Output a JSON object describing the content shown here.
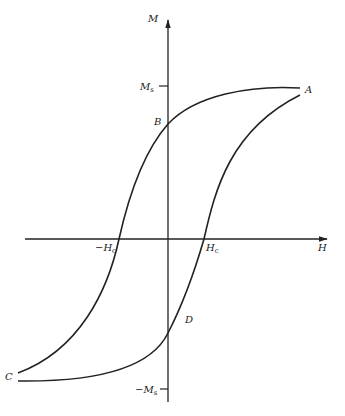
{
  "diagram": {
    "axes": {
      "x_label": "H",
      "y_label": "M"
    },
    "ticks": {
      "ms_pos": {
        "main": "M",
        "sub": "s"
      },
      "ms_neg": {
        "main": "−M",
        "sub": "s"
      },
      "hc_pos": {
        "main": "H",
        "sub": "c"
      },
      "hc_neg": {
        "main": "−H",
        "sub": "c"
      }
    },
    "points": {
      "A": "A",
      "B": "B",
      "C": "C",
      "D": "D"
    },
    "colors": {
      "stroke": "#222222",
      "background": "#ffffff"
    }
  }
}
